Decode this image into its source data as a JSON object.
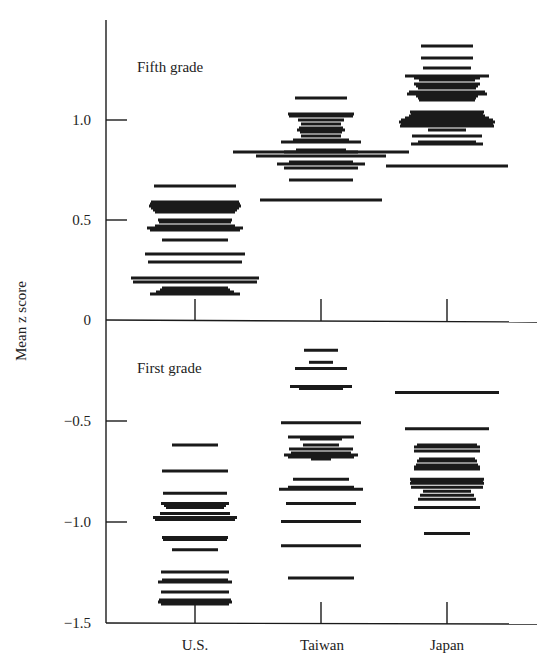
{
  "chart_data": {
    "type": "scatter",
    "subtype": "strip-plot (horizontal dash per classroom/school)",
    "title": "",
    "ylabel": "Mean z score",
    "xlabel": "",
    "categories": [
      "U.S.",
      "Taiwan",
      "Japan"
    ],
    "panels": [
      {
        "label": "Fifth grade",
        "ylim": [
          0,
          1.45
        ],
        "yticks": [
          0,
          0.5,
          1.0
        ],
        "ytick_labels": [
          "0",
          "0.5",
          "1.0"
        ],
        "series": [
          {
            "name": "U.S.",
            "values": [
              0.67,
              0.59,
              0.58,
              0.57,
              0.56,
              0.55,
              0.54,
              0.5,
              0.49,
              0.47,
              0.46,
              0.45,
              0.4,
              0.33,
              0.29,
              0.21,
              0.19,
              0.16,
              0.15,
              0.14,
              0.13
            ],
            "widths": [
              82,
              88,
              90,
              92,
              88,
              84,
              80,
              74,
              72,
              80,
              96,
              90,
              66,
              100,
              94,
              128,
              124,
              66,
              70,
              78,
              90
            ]
          },
          {
            "name": "Taiwan",
            "values": [
              1.11,
              1.03,
              1.02,
              1.0,
              0.98,
              0.96,
              0.95,
              0.94,
              0.92,
              0.9,
              0.89,
              0.85,
              0.84,
              0.84,
              0.82,
              0.79,
              0.78,
              0.76,
              0.7,
              0.6
            ],
            "widths": [
              52,
              66,
              64,
              46,
              40,
              44,
              48,
              42,
              40,
              56,
              80,
              50,
              74,
              176,
              130,
              64,
              88,
              74,
              64,
              122
            ]
          },
          {
            "name": "Japan",
            "values": [
              1.37,
              1.31,
              1.26,
              1.22,
              1.21,
              1.2,
              1.18,
              1.17,
              1.16,
              1.14,
              1.13,
              1.12,
              1.11,
              1.1,
              1.04,
              1.03,
              1.02,
              1.01,
              1.0,
              0.99,
              0.98,
              0.97,
              0.95,
              0.92,
              0.89,
              0.88,
              0.77
            ],
            "widths": [
              52,
              52,
              48,
              84,
              66,
              56,
              66,
              62,
              58,
              76,
              80,
              62,
              58,
              56,
              74,
              72,
              76,
              84,
              92,
              96,
              92,
              94,
              38,
              70,
              58,
              72,
              122
            ]
          }
        ]
      },
      {
        "label": "First grade",
        "ylim": [
          -1.5,
          0
        ],
        "yticks": [
          -1.5,
          -1.0,
          -0.5
        ],
        "ytick_labels": [
          "−1.5",
          "−1.0",
          "−0.5"
        ],
        "series": [
          {
            "name": "U.S.",
            "values": [
              -0.62,
              -0.75,
              -0.86,
              -0.91,
              -0.92,
              -0.93,
              -0.96,
              -0.98,
              -0.99,
              -1.08,
              -1.09,
              -1.14,
              -1.25,
              -1.29,
              -1.3,
              -1.35,
              -1.39,
              -1.4,
              -1.41
            ],
            "widths": [
              46,
              66,
              64,
              68,
              62,
              58,
              70,
              84,
              80,
              66,
              64,
              46,
              68,
              66,
              74,
              68,
              72,
              74,
              68
            ]
          },
          {
            "name": "Taiwan",
            "values": [
              -0.15,
              -0.21,
              -0.24,
              -0.33,
              -0.34,
              -0.51,
              -0.58,
              -0.59,
              -0.62,
              -0.64,
              -0.66,
              -0.67,
              -0.68,
              -0.69,
              -0.79,
              -0.83,
              -0.84,
              -0.91,
              -1.0,
              -1.12,
              -1.28
            ],
            "widths": [
              34,
              24,
              52,
              62,
              44,
              80,
              66,
              42,
              36,
              64,
              60,
              74,
              66,
              20,
              56,
              66,
              84,
              70,
              80,
              80,
              66
            ]
          },
          {
            "name": "Japan",
            "values": [
              -0.36,
              -0.54,
              -0.62,
              -0.63,
              -0.65,
              -0.69,
              -0.7,
              -0.72,
              -0.73,
              -0.74,
              -0.79,
              -0.8,
              -0.81,
              -0.83,
              -0.85,
              -0.87,
              -0.89,
              -0.93,
              -1.06
            ],
            "widths": [
              104,
              84,
              60,
              66,
              66,
              56,
              60,
              62,
              66,
              66,
              74,
              72,
              74,
              72,
              48,
              54,
              58,
              66,
              46
            ]
          }
        ]
      }
    ],
    "grid": false,
    "legend": null
  },
  "labels": {
    "ylabel": "Mean z score",
    "panel_top": "Fifth grade",
    "panel_bottom": "First grade",
    "categories": [
      "U.S.",
      "Taiwan",
      "Japan"
    ],
    "yticks_top": [
      "1.0",
      "0.5",
      "0"
    ],
    "yticks_bottom": [
      "−0.5",
      "−1.0",
      "−1.5"
    ]
  },
  "colors": {
    "ink": "#1a1a1a",
    "background": "#ffffff"
  }
}
